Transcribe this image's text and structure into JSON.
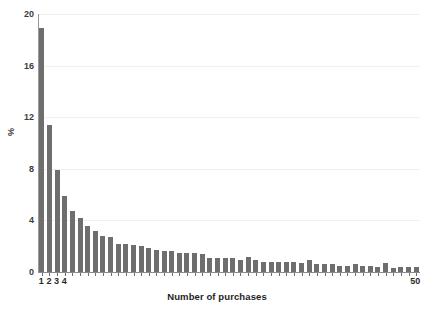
{
  "chart_data": {
    "type": "bar",
    "title": "",
    "subtitle": "",
    "xlabel": "Number of purchases",
    "ylabel": "%",
    "categories": [
      1,
      2,
      3,
      4,
      5,
      6,
      7,
      8,
      9,
      10,
      11,
      12,
      13,
      14,
      15,
      16,
      17,
      18,
      19,
      20,
      21,
      22,
      23,
      24,
      25,
      26,
      27,
      28,
      29,
      30,
      31,
      32,
      33,
      34,
      35,
      36,
      37,
      38,
      39,
      40,
      41,
      42,
      43,
      44,
      45,
      46,
      47,
      48,
      49,
      50
    ],
    "values": [
      18.9,
      11.4,
      7.9,
      5.9,
      4.7,
      4.2,
      3.6,
      3.2,
      2.8,
      2.7,
      2.2,
      2.2,
      2.1,
      2.0,
      1.9,
      1.7,
      1.6,
      1.6,
      1.5,
      1.5,
      1.5,
      1.4,
      1.1,
      1.1,
      1.1,
      1.1,
      0.9,
      1.2,
      0.9,
      0.8,
      0.8,
      0.8,
      0.8,
      0.8,
      0.7,
      0.9,
      0.6,
      0.6,
      0.6,
      0.5,
      0.5,
      0.6,
      0.5,
      0.5,
      0.4,
      0.7,
      0.3,
      0.4,
      0.4,
      0.4
    ],
    "ylim": [
      0,
      20
    ],
    "yticks": [
      0,
      4,
      8,
      12,
      16,
      20
    ],
    "ytick_labels": [
      "0",
      "4",
      "8",
      "12",
      "16",
      "20"
    ],
    "xtick_labels": [
      "1",
      "2",
      "3",
      "4",
      "50"
    ],
    "xtick_positions": [
      1,
      2,
      3,
      4,
      50
    ],
    "grid": "horizontal",
    "legend": "none",
    "bar_color": "#6e6e6e",
    "grid_color": "#f0f0f0",
    "axis_color": "#8a8a8a",
    "text_color": "#2b2b2b",
    "background": "#ffffff"
  }
}
